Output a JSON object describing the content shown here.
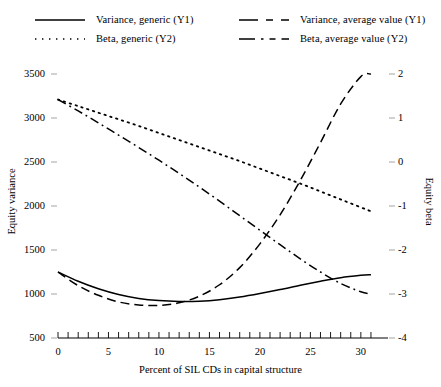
{
  "chart_data": {
    "type": "line",
    "title": "",
    "xlabel": "Percent of SIL CDs in capital structure",
    "ylabel": "Equity variance",
    "ylabel_right": "Equity beta",
    "xlim": [
      0,
      31.5
    ],
    "ylim": [
      500,
      3500
    ],
    "ylim_right": [
      -4,
      2
    ],
    "xticks": [
      0,
      5,
      10,
      15,
      20,
      25,
      30
    ],
    "xtick_labels": [
      "0",
      "5",
      "10",
      "15",
      "20",
      "25",
      "30"
    ],
    "xminor_step": 1,
    "yticks": [
      500,
      1000,
      1500,
      2000,
      2500,
      3000,
      3500
    ],
    "ytick_labels": [
      "500",
      "1000",
      "1500",
      "2000",
      "2500",
      "3000",
      "3500"
    ],
    "yticks_right": [
      -4,
      -3,
      -2,
      -1,
      0,
      1,
      2
    ],
    "ytick_labels_right": [
      "-4",
      "-3",
      "-2",
      "-1",
      "0",
      "1",
      "2"
    ],
    "grid": false,
    "legend_position": "top",
    "series": [
      {
        "name": "Variance, generic (Y1)",
        "axis": "Y1",
        "style": "solid",
        "color": "#000000",
        "x": [
          0,
          2,
          4,
          6,
          8,
          10,
          12,
          14,
          16,
          18,
          20,
          22,
          24,
          26,
          28,
          30,
          31
        ],
        "values": [
          1250,
          1145,
          1060,
          995,
          950,
          925,
          915,
          918,
          935,
          965,
          1005,
          1050,
          1100,
          1145,
          1185,
          1212,
          1220
        ]
      },
      {
        "name": "Beta, generic (Y2)",
        "axis": "Y2",
        "style": "dotted",
        "color": "#000000",
        "x": [
          0,
          2,
          4,
          6,
          8,
          10,
          12,
          14,
          16,
          18,
          20,
          22,
          24,
          26,
          28,
          30,
          31
        ],
        "values": [
          1.42,
          1.27,
          1.12,
          0.97,
          0.82,
          0.66,
          0.5,
          0.34,
          0.18,
          0.02,
          -0.15,
          -0.32,
          -0.49,
          -0.67,
          -0.85,
          -1.03,
          -1.12
        ]
      },
      {
        "name": "Variance, average value (Y1)",
        "axis": "Y1",
        "style": "dashed",
        "color": "#000000",
        "x": [
          0,
          2,
          4,
          6,
          8,
          10,
          12,
          14,
          16,
          18,
          20,
          22,
          24,
          26,
          28,
          30,
          31
        ],
        "values": [
          1250,
          1095,
          985,
          910,
          875,
          870,
          900,
          975,
          1105,
          1300,
          1570,
          1900,
          2290,
          2720,
          3160,
          3470,
          3500
        ]
      },
      {
        "name": "Beta, average value (Y2)",
        "axis": "Y2",
        "style": "dashdot",
        "color": "#000000",
        "x": [
          0,
          2,
          4,
          6,
          8,
          10,
          12,
          14,
          16,
          18,
          20,
          22,
          24,
          26,
          28,
          30,
          31
        ],
        "values": [
          1.42,
          1.16,
          0.89,
          0.61,
          0.33,
          0.04,
          -0.26,
          -0.57,
          -0.89,
          -1.22,
          -1.55,
          -1.88,
          -2.2,
          -2.5,
          -2.76,
          -2.95,
          -3.0
        ]
      }
    ]
  },
  "legend": {
    "entries": [
      {
        "label": "Variance, generic (Y1)",
        "style": "solid"
      },
      {
        "label": "Beta, generic (Y2)",
        "style": "dotted"
      },
      {
        "label": "Variance, average value (Y1)",
        "style": "dashed"
      },
      {
        "label": "Beta, average value (Y2)",
        "style": "dashdot"
      }
    ]
  }
}
